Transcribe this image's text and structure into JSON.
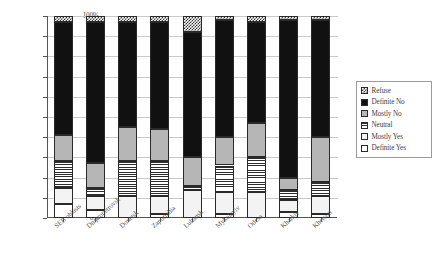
{
  "chart_data": {
    "type": "bar",
    "subtype": "stacked-percentage-bar",
    "title": "",
    "xlabel": "",
    "ylabel": "",
    "ylim": [
      0,
      100
    ],
    "y_tick_labels": [
      "0%",
      "10%",
      "20%",
      "30%",
      "40%",
      "50%",
      "60%",
      "70%",
      "80%",
      "90%",
      "100%"
    ],
    "y_tick_values": [
      0,
      10,
      20,
      30,
      40,
      50,
      60,
      70,
      80,
      90,
      100
    ],
    "grid": true,
    "legend_position": "right",
    "categories": [
      "SEB oblasts",
      "Dnipropetrovsk",
      "Donetsk",
      "Zaporizhia",
      "Luhansk",
      "Mykolayiv",
      "Odesa",
      "Kharkiv",
      "Kherson"
    ],
    "series": [
      {
        "name": "Definite Yes",
        "pattern": "white",
        "values": [
          7,
          4,
          0,
          2,
          0,
          2,
          0,
          3,
          2
        ]
      },
      {
        "name": "Mostly Yes",
        "pattern": "very-light",
        "values": [
          8,
          7,
          11,
          9,
          14,
          11,
          13,
          6,
          9
        ]
      },
      {
        "name": "Neutral",
        "pattern": "horizontal-stripes",
        "values": [
          13,
          4,
          17,
          17,
          2,
          13,
          17,
          5,
          7
        ]
      },
      {
        "name": "Mostly No",
        "pattern": "light-gray",
        "values": [
          13,
          12,
          17,
          16,
          14,
          14,
          17,
          6,
          22
        ]
      },
      {
        "name": "Definite No",
        "pattern": "solid-black",
        "values": [
          56,
          70,
          52,
          53,
          62,
          58,
          50,
          78,
          58
        ]
      },
      {
        "name": "Refuse",
        "pattern": "checkered",
        "values": [
          3,
          3,
          3,
          3,
          8,
          2,
          3,
          2,
          2
        ]
      }
    ],
    "stack_order_bottom_to_top": [
      "Definite Yes",
      "Mostly Yes",
      "Neutral",
      "Mostly No",
      "Definite No",
      "Refuse"
    ]
  },
  "legend": {
    "entries": [
      {
        "label": "Refuse",
        "pattern": "checkered"
      },
      {
        "label": "Definite No",
        "pattern": "solid-black"
      },
      {
        "label": "Mostly No",
        "pattern": "light-gray"
      },
      {
        "label": "Neutral",
        "pattern": "horizontal-stripes"
      },
      {
        "label": "Mostly Yes",
        "pattern": "very-light"
      },
      {
        "label": "Definite Yes",
        "pattern": "white"
      }
    ]
  }
}
